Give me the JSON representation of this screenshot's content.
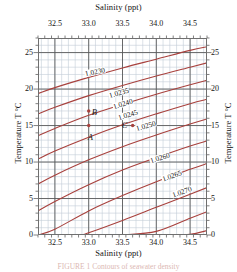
{
  "chart_data": {
    "type": "line",
    "title": "Salinity (ppt)",
    "xlabel": "Salinity (ppt)",
    "ylabel": "Temperature T °C",
    "xlim": [
      32.25,
      34.75
    ],
    "ylim": [
      0,
      27
    ],
    "grid": true,
    "grid_minor_step_x": 0.1,
    "grid_minor_step_y": 1,
    "grid_major_step_x": 0.5,
    "grid_major_step_y": 5,
    "legend": "none",
    "curve_color": "#a8413d",
    "series": [
      {
        "name": "1.0230",
        "x": [
          32.25,
          32.5,
          33.0,
          33.5,
          34.0,
          34.5,
          34.75
        ],
        "y": [
          19.4,
          20.2,
          21.6,
          22.9,
          24.1,
          25.3,
          25.8
        ]
      },
      {
        "name": "1.0235",
        "x": [
          32.25,
          32.5,
          33.0,
          33.5,
          34.0,
          34.5,
          34.75
        ],
        "y": [
          16.6,
          17.5,
          19.1,
          20.5,
          21.8,
          23.0,
          23.6
        ]
      },
      {
        "name": "1.0240",
        "x": [
          32.25,
          32.5,
          33.0,
          33.5,
          34.0,
          34.5,
          34.75
        ],
        "y": [
          13.6,
          14.6,
          16.4,
          17.9,
          19.3,
          20.6,
          21.2
        ]
      },
      {
        "name": "1.0245",
        "x": [
          32.25,
          32.5,
          33.0,
          33.5,
          34.0,
          34.5,
          34.75
        ],
        "y": [
          10.4,
          11.5,
          13.4,
          15.1,
          16.6,
          18.0,
          18.6
        ]
      },
      {
        "name": "1.0250",
        "x": [
          32.25,
          32.5,
          33.0,
          33.5,
          34.0,
          34.5,
          34.75
        ],
        "y": [
          7.0,
          8.2,
          10.3,
          12.1,
          13.7,
          15.2,
          15.9
        ]
      },
      {
        "name": "1.0255",
        "x": [
          32.25,
          32.5,
          33.0,
          33.5,
          34.0,
          34.5,
          34.75
        ],
        "y": [
          3.3,
          4.6,
          6.9,
          8.9,
          10.6,
          12.2,
          12.9
        ]
      },
      {
        "name": "1.0260",
        "x": [
          32.25,
          32.5,
          33.0,
          33.5,
          34.0,
          34.5,
          34.75
        ],
        "y": [
          0.0,
          0.8,
          3.3,
          5.4,
          7.3,
          9.0,
          9.8
        ]
      },
      {
        "name": "1.0265",
        "x": [
          32.9,
          33.0,
          33.5,
          34.0,
          34.5,
          34.75
        ],
        "y": [
          0.0,
          0.3,
          2.0,
          3.8,
          5.6,
          6.5
        ]
      },
      {
        "name": "1.0270",
        "x": [
          33.5,
          34.0,
          34.5,
          34.75
        ],
        "y": [
          0.0,
          0.5,
          2.3,
          3.2
        ]
      },
      {
        "name": "1.0275",
        "x": [
          34.15,
          34.5,
          34.75
        ],
        "y": [
          0.0,
          0.1,
          0.6
        ]
      }
    ],
    "contour_labels": [
      {
        "value": "1.0230",
        "x": 33.1,
        "y": 22.3,
        "rotate": -12
      },
      {
        "value": "1.0235",
        "x": 33.45,
        "y": 19.5,
        "rotate": -16
      },
      {
        "value": "1.0240",
        "x": 33.5,
        "y": 17.9,
        "rotate": -17
      },
      {
        "value": "1.0245",
        "x": 33.58,
        "y": 16.4,
        "rotate": -17
      },
      {
        "value": "1.0250",
        "x": 33.85,
        "y": 14.9,
        "rotate": -16
      },
      {
        "value": "1.0260",
        "x": 34.05,
        "y": 10.6,
        "rotate": -17
      },
      {
        "value": "1.0265",
        "x": 34.23,
        "y": 8.1,
        "rotate": -19
      },
      {
        "value": "1.0270",
        "x": 34.38,
        "y": 5.9,
        "rotate": -19
      }
    ],
    "points": [
      {
        "label": "A",
        "x": 33.0,
        "y": 15.0,
        "label_dx": -1,
        "label_dy": 11
      },
      {
        "label": "B",
        "x": 33.0,
        "y": 17.0,
        "label_dx": 3,
        "label_dy": 1
      },
      {
        "label": "C",
        "x": 33.65,
        "y": 15.0,
        "label_dx": -11,
        "label_dy": -1
      }
    ],
    "x_ticks": [
      {
        "value": 32.5,
        "label": "32.5"
      },
      {
        "value": 33.0,
        "label": "33.0"
      },
      {
        "value": 33.5,
        "label": "33.5"
      },
      {
        "value": 34.0,
        "label": "34.0"
      },
      {
        "value": 34.5,
        "label": "34.5"
      }
    ],
    "y_ticks": [
      {
        "value": 0,
        "label": "0"
      },
      {
        "value": 5,
        "label": "5"
      },
      {
        "value": 10,
        "label": "10"
      },
      {
        "value": 15,
        "label": "15"
      },
      {
        "value": 20,
        "label": "20"
      },
      {
        "value": 25,
        "label": "25"
      }
    ]
  },
  "figure": {
    "top_axis_title": "Salinity (ppt)",
    "bottom_axis_title": "Salinity (ppt)",
    "left_axis_title": "Temperature T °C",
    "right_axis_title": "Temperature T °C",
    "caption": "FIGURE 1 Contours of seawater density"
  },
  "colors": {
    "curve": "#a8413d",
    "minor_grid": "#c3cdd6",
    "major_grid": "#595959",
    "frame": "#6f6f6f",
    "text": "#141414"
  }
}
